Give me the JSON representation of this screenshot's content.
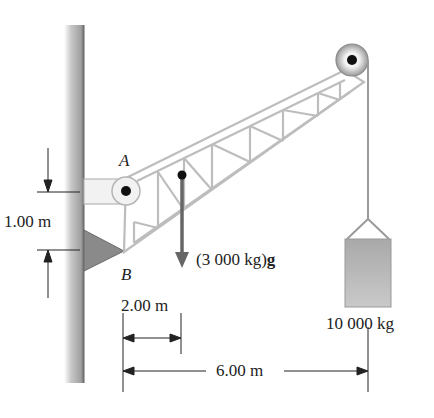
{
  "diagram": {
    "type": "crane-boom statics figure",
    "points": {
      "A": "A",
      "B": "B"
    },
    "dimensions": {
      "vertical_AB": "1.00 m",
      "cm_distance": "2.00 m",
      "load_distance": "6.00 m"
    },
    "forces": {
      "boom_weight": "(3 000 kg)",
      "boom_weight_vector": "g"
    },
    "load": {
      "mass": "10 000 kg"
    },
    "colors": {
      "wall": "#9a9a9a",
      "bracket": "#7a7a7a",
      "boom_outline": "#b8b8b8",
      "weight_arrow": "#6a6a6a",
      "load_box": "#b5b5b5",
      "pin": "#111111"
    }
  }
}
